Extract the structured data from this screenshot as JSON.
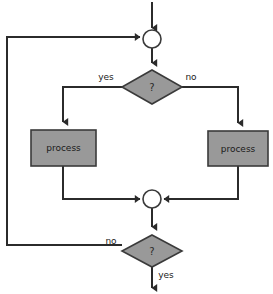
{
  "diagram": {
    "canvas": {
      "width": 273,
      "height": 294,
      "background": "#ffffff"
    },
    "palette": {
      "node_fill_gray": "#999999",
      "node_fill_white": "#ffffff",
      "node_stroke": "#3a3a3a",
      "edge_stroke": "#2b2b2b",
      "text": "#1a1a1a"
    },
    "nodes": [
      {
        "id": "merge-top",
        "type": "connector-circle",
        "label": "",
        "cx": 152,
        "cy": 39,
        "r": 9
      },
      {
        "id": "decision-top",
        "type": "decision-diamond",
        "label": "?",
        "cx": 152,
        "cy": 87,
        "rx": 30,
        "ry": 17
      },
      {
        "id": "process-left",
        "type": "process-box",
        "label": "process",
        "x": 31,
        "y": 130,
        "w": 65,
        "h": 36
      },
      {
        "id": "process-right",
        "type": "process-box",
        "label": "process",
        "x": 208,
        "y": 131,
        "w": 60,
        "h": 35
      },
      {
        "id": "merge-bottom",
        "type": "connector-circle",
        "label": "",
        "cx": 152,
        "cy": 199,
        "r": 9
      },
      {
        "id": "decision-bottom",
        "type": "decision-diamond",
        "label": "?",
        "cx": 152,
        "cy": 251,
        "rx": 30,
        "ry": 16
      }
    ],
    "edge_labels": [
      {
        "id": "label-yes-top",
        "text": "yes",
        "x": 106,
        "y": 77
      },
      {
        "id": "label-no-top",
        "text": "no",
        "x": 191,
        "y": 77
      },
      {
        "id": "label-no-bottom",
        "text": "no",
        "x": 111,
        "y": 241
      },
      {
        "id": "label-yes-bottom",
        "text": "yes",
        "x": 166,
        "y": 275
      }
    ]
  }
}
